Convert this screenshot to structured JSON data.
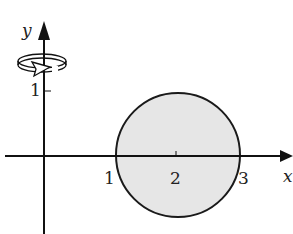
{
  "diagram": {
    "axes": {
      "x_label": "x",
      "y_label": "y",
      "x_ticks": [
        "1",
        "2",
        "3"
      ],
      "y_ticks": [
        "1"
      ]
    },
    "region": {
      "shape": "circle",
      "center": [
        2,
        0
      ],
      "radius": 1,
      "fill_color": "#e6e6e6",
      "stroke_color": "#1a1a1a"
    },
    "rotation_indicator": {
      "axis": "y",
      "icon": "rotation-arrow-icon"
    },
    "colors": {
      "axis": "#111111",
      "text": "#222222",
      "background": "#ffffff"
    }
  }
}
